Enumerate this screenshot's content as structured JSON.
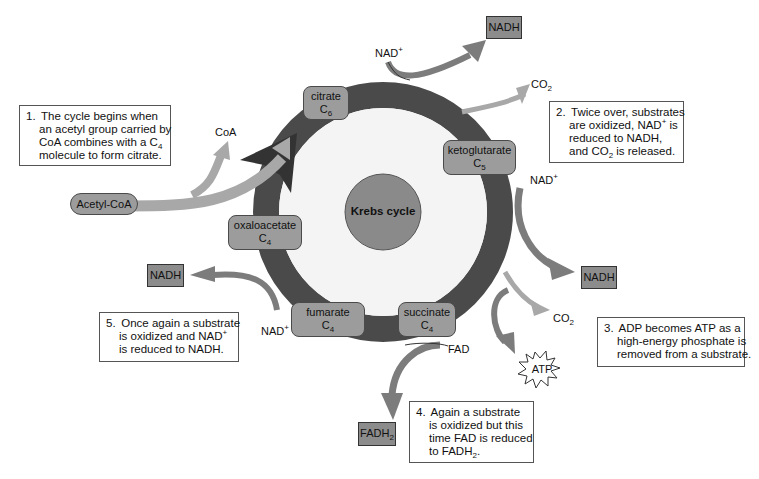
{
  "diagram": {
    "title": "Krebs cycle",
    "colors": {
      "ring": "#4a4a4a",
      "center": "#8a8a8a",
      "node_fill": "#9c9c9c",
      "product_fill": "#8c8c8c",
      "arrow_light": "#a8a8a8",
      "arrow_mid": "#7c7c7c"
    },
    "intermediates": [
      {
        "name": "citrate",
        "carbons": "C",
        "sub": "6"
      },
      {
        "name": "ketoglutarate",
        "carbons": "C",
        "sub": "5"
      },
      {
        "name": "succinate",
        "carbons": "C",
        "sub": "4"
      },
      {
        "name": "fumarate",
        "carbons": "C",
        "sub": "4"
      },
      {
        "name": "oxaloacetate",
        "carbons": "C",
        "sub": "4"
      }
    ],
    "input": {
      "label": "Acetyl-CoA"
    },
    "labels": {
      "coa": "CoA",
      "nad": "NAD",
      "plus": "+",
      "co2": "CO",
      "two": "2",
      "fad": "FAD",
      "atp": "ATP"
    },
    "products": {
      "nadh_top": "NADH",
      "nadh_right": "NADH",
      "nadh_left": "NADH",
      "fadh2": "FADH",
      "fadh2_sub": "2"
    },
    "notes": [
      {
        "number": "1.",
        "lines": [
          "The cycle begins when",
          "an acetyl group carried by",
          "CoA combines with a C",
          "molecule to form citrate."
        ],
        "sub": "4"
      },
      {
        "number": "2.",
        "lines": [
          "Twice over, substrates",
          "are oxidized, NAD",
          " is",
          "reduced to NADH,",
          "and CO",
          " is released."
        ],
        "sup": "+",
        "sub": "2"
      },
      {
        "number": "3.",
        "lines": [
          "ADP becomes ATP as a",
          "high-energy phosphate is",
          "removed from a substrate."
        ]
      },
      {
        "number": "4.",
        "lines": [
          "Again a substrate",
          "is oxidized but this",
          "time FAD is reduced",
          "to FADH",
          "."
        ],
        "sub": "2"
      },
      {
        "number": "5.",
        "lines": [
          "Once again a substrate",
          "is oxidized and NAD",
          "is reduced to NADH."
        ],
        "sup": "+"
      }
    ]
  }
}
